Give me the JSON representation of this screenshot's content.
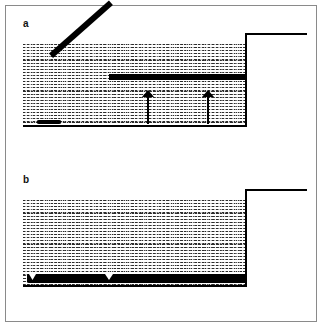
{
  "figure": {
    "type": "two-panel schematic diagram",
    "background_color": "#ffffff",
    "ink_color": "#000000",
    "frame_color": "#8a8a8a",
    "width": 326,
    "height": 329
  },
  "panels": [
    {
      "id": "panel-a",
      "label": "a",
      "label_x": 22,
      "label_y": 19,
      "state_description": "deployed",
      "tank": {
        "water_left": 22,
        "water_top": 44,
        "water_right": 244,
        "water_bottom": 125,
        "floor_thickness": 2,
        "wall_thickness": 2,
        "bank_top_y": 33,
        "bank_right_x": 306
      },
      "barrier": {
        "horizontal": {
          "x": 108,
          "y": 74,
          "width": 136,
          "height": 6
        },
        "diagonal": {
          "x1": 52,
          "y1": 124,
          "x2": 110,
          "y2": 72,
          "thickness": 6
        },
        "foot": {
          "x": 36,
          "y": 120,
          "width": 22,
          "height": 4
        }
      },
      "arrows": [
        {
          "id": "arrow-left",
          "x": 140,
          "y": 90,
          "height": 30,
          "direction": "up"
        },
        {
          "id": "arrow-right",
          "x": 200,
          "y": 90,
          "height": 30,
          "direction": "up"
        }
      ]
    },
    {
      "id": "panel-b",
      "label": "b",
      "label_x": 22,
      "label_y": 175,
      "state_description": "collapsed",
      "tank": {
        "water_left": 22,
        "water_top": 199,
        "water_right": 244,
        "water_bottom": 285,
        "floor_thickness": 2,
        "wall_thickness": 2,
        "bank_top_y": 188,
        "bank_right_x": 306
      },
      "barrier": {
        "flat": {
          "x": 26,
          "y": 272,
          "width": 218,
          "height": 8
        },
        "notches": [
          {
            "x": 28,
            "y": 272,
            "width": 6,
            "height": 5
          },
          {
            "x": 104,
            "y": 272,
            "width": 7,
            "height": 5
          }
        ]
      },
      "arrows": []
    }
  ]
}
